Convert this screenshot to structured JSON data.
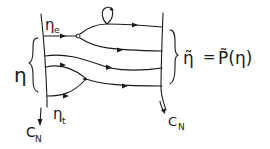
{
  "diagram": {
    "type": "flow-map",
    "left_boundary": {
      "label_top": "ηe",
      "label_bottom": "ηt",
      "section_label": "C_N"
    },
    "right_boundary": {
      "section_label": "C_N"
    },
    "left_brace_label": "η",
    "equation": {
      "lhs": "η̃",
      "eq": "=",
      "rhs": "P̃(η)"
    },
    "labels": {
      "eta_left": "η",
      "eta_e_main": "η",
      "eta_e_sub": "e",
      "eta_t_main": "η",
      "eta_t_sub": "t",
      "cn_left_main": "C",
      "cn_left_sub": "N",
      "cn_right_main": "C",
      "cn_right_sub": "N",
      "eq_lhs": "η̃",
      "eq_sign": "=",
      "eq_rhs": "P̃(η)"
    },
    "elements": [
      "entry trajectory from ηe splitting at a node",
      "loop (periodic orbit) on upper trajectory",
      "two trajectories merging at node from ηt",
      "right-side brace grouping exits"
    ]
  }
}
